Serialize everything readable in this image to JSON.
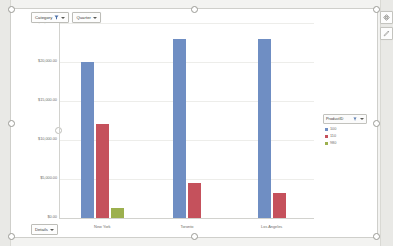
{
  "window": {
    "title": "Pivot Chart"
  },
  "filters": [
    {
      "label": "Category",
      "icon": "funnel-icon",
      "has_caret": true
    },
    {
      "label": "Quarter",
      "icon": "",
      "has_caret": true
    }
  ],
  "toolbar": {
    "move_icon": "move-icon",
    "edit_icon": "pencil-icon"
  },
  "footer": {
    "details_label": "Details",
    "details_caret": true
  },
  "legend": {
    "title": "ProductID",
    "filter_icon": "funnel-icon",
    "caret": true,
    "entries": [
      {
        "label": "100",
        "color": "#6f8ec3"
      },
      {
        "label": "110",
        "color": "#c5515c"
      },
      {
        "label": "980",
        "color": "#9cb04e"
      }
    ]
  },
  "chart_data": {
    "type": "bar",
    "title": "",
    "subtitle": "",
    "xlabel": "",
    "ylabel": "",
    "grid": true,
    "legend_position": "right",
    "categories": [
      "New York",
      "Toronto",
      "Los Angeles"
    ],
    "ytick_labels": [
      "$25,000.00",
      "$20,000.00",
      "$15,000.00",
      "$10,000.00",
      "$5,000.00",
      "$0.00"
    ],
    "ylim": [
      0,
      25000
    ],
    "ytick_values": [
      25000,
      20000,
      15000,
      10000,
      5000,
      0
    ],
    "series": [
      {
        "name": "100",
        "color": "#6f8ec3",
        "values": [
          20000,
          23000,
          23000
        ]
      },
      {
        "name": "110",
        "color": "#c5515c",
        "values": [
          12000,
          4500,
          3200
        ]
      },
      {
        "name": "980",
        "color": "#9cb04e",
        "values": [
          1300,
          0,
          0
        ]
      }
    ]
  }
}
